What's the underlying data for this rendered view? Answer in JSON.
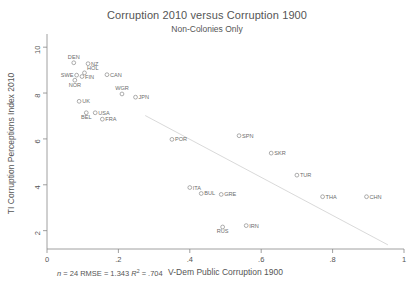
{
  "chart_data": {
    "type": "scatter",
    "title": "Corruption 2010 versus Corruption 1900",
    "subtitle": "Non-Colonies Only",
    "xlabel": "V-Dem Public Corruption 1900",
    "ylabel": "TI Corruption Perceptions Index 2010",
    "xlim": [
      0,
      1
    ],
    "ylim": [
      1.2,
      10.4
    ],
    "xticks": [
      "0",
      ".2",
      ".4",
      ".6",
      ".8",
      "1"
    ],
    "xtick_values": [
      0,
      0.2,
      0.4,
      0.6,
      0.8,
      1
    ],
    "yticks": [
      "2",
      "4",
      "6",
      "8",
      "10"
    ],
    "ytick_values": [
      2,
      4,
      6,
      8,
      10
    ],
    "grid": false,
    "legend": "none",
    "marker_style": "open-circle",
    "points": [
      {
        "label": "DEN",
        "x": 0.075,
        "y": 9.32,
        "label_pos": "above"
      },
      {
        "label": "NZ",
        "x": 0.115,
        "y": 9.28,
        "label_pos": "right"
      },
      {
        "label": "SWE",
        "x": 0.083,
        "y": 8.78,
        "label_pos": "left"
      },
      {
        "label": "HOL",
        "x": 0.105,
        "y": 8.88,
        "label_pos": "above-right"
      },
      {
        "label": "FIN",
        "x": 0.098,
        "y": 8.72,
        "label_pos": "right"
      },
      {
        "label": "NOR",
        "x": 0.078,
        "y": 8.56,
        "label_pos": "below"
      },
      {
        "label": "CAN",
        "x": 0.168,
        "y": 8.8,
        "label_pos": "right"
      },
      {
        "label": "WGR",
        "x": 0.21,
        "y": 7.96,
        "label_pos": "above"
      },
      {
        "label": "JPN",
        "x": 0.248,
        "y": 7.82,
        "label_pos": "right"
      },
      {
        "label": "UK",
        "x": 0.09,
        "y": 7.64,
        "label_pos": "right"
      },
      {
        "label": "USA",
        "x": 0.135,
        "y": 7.14,
        "label_pos": "right"
      },
      {
        "label": "BEL",
        "x": 0.11,
        "y": 7.14,
        "label_pos": "below"
      },
      {
        "label": "FRA",
        "x": 0.155,
        "y": 6.86,
        "label_pos": "right"
      },
      {
        "label": "POR",
        "x": 0.35,
        "y": 5.98,
        "label_pos": "right"
      },
      {
        "label": "SPN",
        "x": 0.538,
        "y": 6.14,
        "label_pos": "right"
      },
      {
        "label": "SKR",
        "x": 0.628,
        "y": 5.38,
        "label_pos": "right"
      },
      {
        "label": "TUR",
        "x": 0.7,
        "y": 4.42,
        "label_pos": "right"
      },
      {
        "label": "ITA",
        "x": 0.4,
        "y": 3.88,
        "label_pos": "right"
      },
      {
        "label": "BUL",
        "x": 0.432,
        "y": 3.62,
        "label_pos": "right"
      },
      {
        "label": "GRE",
        "x": 0.488,
        "y": 3.58,
        "label_pos": "right"
      },
      {
        "label": "THA",
        "x": 0.772,
        "y": 3.48,
        "label_pos": "right"
      },
      {
        "label": "CHN",
        "x": 0.895,
        "y": 3.48,
        "label_pos": "right"
      },
      {
        "label": "RUS",
        "x": 0.492,
        "y": 2.16,
        "label_pos": "below"
      },
      {
        "label": "IRN",
        "x": 0.558,
        "y": 2.22,
        "label_pos": "right"
      }
    ],
    "fit_line": {
      "x0": 0.275,
      "y0": 7.02,
      "x1": 0.955,
      "y1": 1.38
    },
    "stats": {
      "n_label": "n",
      "n_value": " = 24",
      "rmse": "RMSE = 1.343",
      "r2_prefix": "R",
      "r2_sup": "2",
      "r2_value": " = .704"
    }
  }
}
